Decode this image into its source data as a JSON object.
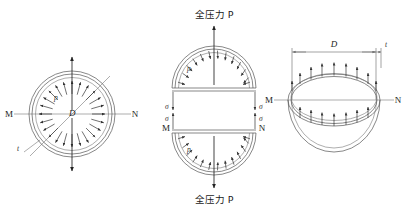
{
  "diagram": {
    "background_color": "#ffffff",
    "line_color": "#555555",
    "arrow_color": "#222222",
    "figures": [
      {
        "id": "fig-left",
        "name": "full-sphere-section",
        "description": "Circular cross-section of thin-walled sphere with internal pressure p acting radially outward",
        "labels": {
          "left_point": "M",
          "right_point": "N",
          "diameter": "D",
          "pressure": "p",
          "thickness": "t"
        },
        "geometry": {
          "center_x": 72,
          "center_y": 114,
          "outer_radius": 43,
          "inner_radius": 39,
          "radial_arrow_count": 24
        }
      },
      {
        "id": "fig-middle",
        "name": "split-hemisphere-free-body",
        "description": "Upper and lower hemisphere free-body diagrams showing resultant total pressure P and wall stress sigma",
        "labels": {
          "top_force": "全压力 P",
          "bottom_force": "全压力 P",
          "stress": "σ",
          "pressure": "p",
          "left_point": "M",
          "right_point": "N"
        },
        "geometry": {
          "center_x": 214,
          "upper_base_y": 88,
          "lower_base_y": 130,
          "outer_radius": 42,
          "inner_radius": 38,
          "radial_arrow_count": 13
        }
      },
      {
        "id": "fig-right",
        "name": "hemisphere-3d-view",
        "description": "Three-dimensional hemisphere bowl view with dimension D, wall thickness t and upward pressure arrows on rim",
        "labels": {
          "diameter": "D",
          "thickness": "t",
          "left_point": "M",
          "right_point": "N"
        },
        "geometry": {
          "center_x": 334,
          "center_y": 100,
          "ellipse_rx": 46,
          "ellipse_ry": 26,
          "bowl_depth": 52,
          "rim_arrow_count": 11
        }
      }
    ]
  }
}
